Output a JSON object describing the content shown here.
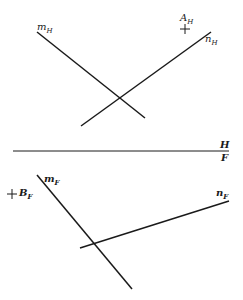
{
  "diagram": {
    "top_view": {
      "name": "H",
      "lines": [
        {
          "label": "m",
          "subscript": "H",
          "x1": 37,
          "y1": 32,
          "x2": 145,
          "y2": 118
        },
        {
          "label": "n",
          "subscript": "H",
          "x1": 81,
          "y1": 126,
          "x2": 211,
          "y2": 32
        }
      ],
      "points": [
        {
          "label": "A",
          "subscript": "H",
          "x": 185,
          "y": 29
        }
      ]
    },
    "folding_line": {
      "x1": 13,
      "y1": 151,
      "x2": 229,
      "y2": 151,
      "label_above": "H",
      "label_below": "F"
    },
    "front_view": {
      "name": "F",
      "lines": [
        {
          "label": "m",
          "subscript": "F",
          "x1": 37,
          "y1": 175,
          "x2": 132,
          "y2": 289
        },
        {
          "label": "n",
          "subscript": "F",
          "x1": 80,
          "y1": 248,
          "x2": 229,
          "y2": 201
        }
      ],
      "points": [
        {
          "label": "B",
          "subscript": "F",
          "x": 12,
          "y": 194
        }
      ]
    }
  },
  "labels": {
    "mH": {
      "main": "m",
      "sub": "H"
    },
    "nH": {
      "main": "n",
      "sub": "H"
    },
    "AH": {
      "main": "A",
      "sub": "H"
    },
    "H": "H",
    "F": "F",
    "mF": {
      "main": "m",
      "sub": "F"
    },
    "nF": {
      "main": "n",
      "sub": "F"
    },
    "BF": {
      "main": "B",
      "sub": "F"
    }
  }
}
